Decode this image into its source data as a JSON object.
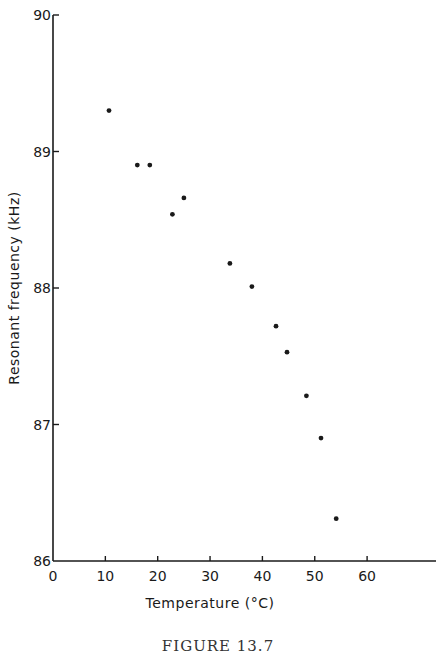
{
  "chart_data": {
    "type": "scatter",
    "title": "",
    "xlabel": "Temperature (°C)",
    "ylabel": "Resonant frequency (kHz)",
    "xlim": [
      0,
      73
    ],
    "ylim": [
      86,
      90
    ],
    "xticks": [
      0,
      10,
      20,
      30,
      40,
      50,
      60
    ],
    "yticks": [
      86,
      87,
      88,
      89,
      90
    ],
    "grid": false,
    "legend": null,
    "series": [
      {
        "name": "Resonant frequency",
        "x": [
          10.7,
          16.1,
          18.5,
          22.8,
          25.0,
          33.8,
          38.0,
          42.6,
          44.7,
          48.4,
          51.2,
          54.1
        ],
        "y": [
          89.3,
          88.9,
          88.9,
          88.54,
          88.66,
          88.18,
          88.01,
          87.72,
          87.53,
          87.21,
          86.9,
          86.31
        ]
      }
    ],
    "caption": "FIGURE 13.7"
  },
  "colors": {
    "ink": "#1a1a1a",
    "background": "#ffffff"
  }
}
